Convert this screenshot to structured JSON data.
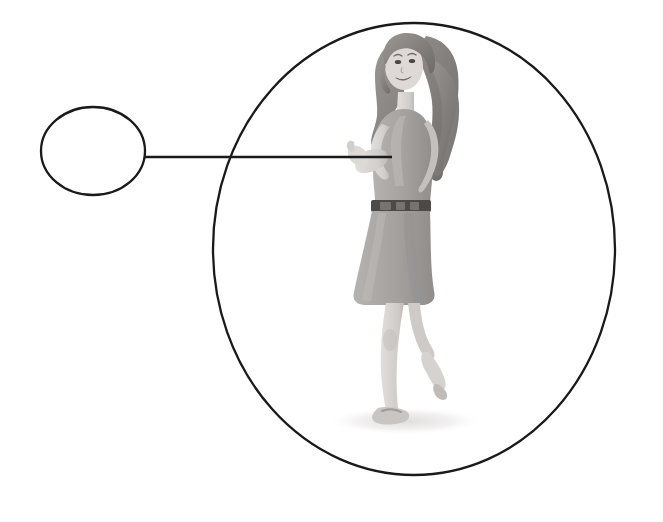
{
  "canvas": {
    "width": 663,
    "height": 522,
    "background_color": "#ffffff",
    "title": "Callout diagram: empty circle linked to woman in large ellipse"
  },
  "style": {
    "stroke_color": "#1a1a1a",
    "stroke_width": 2,
    "leader_line_color": "#1a1a1a",
    "leader_line_width": 2.5,
    "hair_color": "#8d8a88",
    "hair_dark_color": "#6f6c6b",
    "skin_color": "#d8d4d1",
    "skin_shadow_color": "#bcb8b5",
    "dress_color": "#a9a6a4",
    "dress_dark_color": "#918e8c",
    "belt_color": "#4c4a49",
    "ground_shadow_color": "#e6e4e3"
  },
  "shapes": {
    "callout_circle": {
      "name": "empty callout circle",
      "cx": 93,
      "cy": 151,
      "rx": 52,
      "ry": 44,
      "fill": "none",
      "label": ""
    },
    "main_ellipse": {
      "name": "large ellipse containing figure",
      "cx": 414,
      "cy": 249,
      "rx": 201,
      "ry": 226,
      "fill": "none"
    },
    "leader_line": {
      "name": "connector line",
      "x1": 145,
      "y1": 157,
      "x2": 392,
      "y2": 157
    }
  },
  "figure": {
    "name": "illustrated woman",
    "bounds": {
      "x": 345,
      "y": 33,
      "width": 128,
      "height": 405
    },
    "parts": [
      {
        "name": "hair",
        "tone": "#8d8a88"
      },
      {
        "name": "face",
        "tone": "#e0dcd9"
      },
      {
        "name": "torso",
        "tone": "#a9a6a4"
      },
      {
        "name": "belt",
        "tone": "#4c4a49"
      },
      {
        "name": "skirt",
        "tone": "#a9a6a4"
      },
      {
        "name": "legs",
        "tone": "#d4d0cd"
      },
      {
        "name": "sandals",
        "tone": "#bfbbb8"
      },
      {
        "name": "ground-shadow",
        "tone": "#e6e4e3"
      }
    ]
  }
}
